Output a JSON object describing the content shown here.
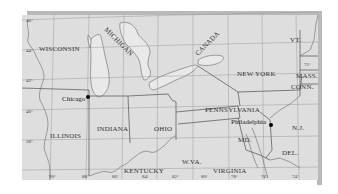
{
  "map": {
    "colors": {
      "background": "#ffffff",
      "land": "#dedede",
      "water": "#e9e9e9",
      "shadow": "#b9b9b9",
      "border": "#6e6e6e",
      "grid": "#9a9a9a",
      "city_dot": "#000000"
    },
    "labels": {
      "states": {
        "wisconsin": "WISCONSIN",
        "michigan": "MICHIGAN",
        "canada": "CANADA",
        "new_york": "NEW YORK",
        "vermont": "VT.",
        "massachusetts": "MASS.",
        "connecticut": "CONN.",
        "illinois": "ILLINOIS",
        "indiana": "INDIANA",
        "ohio": "OHIO",
        "pennsylvania": "PENNSYLVANIA",
        "new_jersey": "N.J.",
        "maryland": "MD.",
        "delaware": "DEL.",
        "west_virginia": "W.VA.",
        "virginia": "VIRGINIA",
        "kentucky": "KENTUCKY"
      },
      "cities": [
        {
          "name": "Chicago"
        },
        {
          "name": "Philadelphia"
        }
      ],
      "latitudes": [
        "46°",
        "44°",
        "42°",
        "40°",
        "38°"
      ],
      "longitudes": [
        "90°",
        "88°",
        "86°",
        "84°",
        "82°",
        "80°",
        "78°",
        "76°",
        "74°"
      ],
      "extra_longitude": "72°"
    }
  }
}
